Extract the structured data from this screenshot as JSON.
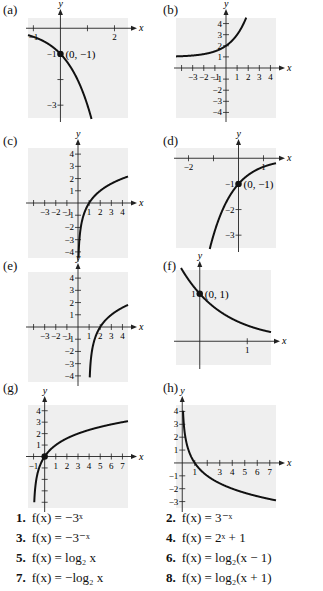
{
  "panels": [
    {
      "label": "(a)"
    },
    {
      "label": "(b)"
    },
    {
      "label": "(c)"
    },
    {
      "label": "(d)"
    },
    {
      "label": "(e)"
    },
    {
      "label": "(f)"
    },
    {
      "label": "(g)"
    },
    {
      "label": "(h)"
    }
  ],
  "choices": [
    {
      "num": "1.",
      "text": "f(x) = −3ˣ"
    },
    {
      "num": "2.",
      "text": "f(x) = 3⁻ˣ"
    },
    {
      "num": "3.",
      "text": "f(x) = −3⁻ˣ"
    },
    {
      "num": "4.",
      "text": "f(x) = 2ˣ + 1"
    },
    {
      "num": "5.",
      "text": "f(x) = log₂ x"
    },
    {
      "num": "6.",
      "text": "f(x) = log₂(x − 1)"
    },
    {
      "num": "7.",
      "text": "f(x) = −log₂ x"
    },
    {
      "num": "8.",
      "text": "f(x) = log₂(x + 1)"
    }
  ],
  "colors": {
    "plot_bg": "#efefef",
    "curve": "#111111",
    "axis": "#222222"
  },
  "chart_data": [
    {
      "panel": "(a)",
      "type": "line",
      "xlabel": "x",
      "ylabel": "y",
      "xlim": [
        -1.2,
        2.5
      ],
      "ylim": [
        -3.5,
        0.4
      ],
      "xticks": [
        -1,
        1,
        2
      ],
      "xtick_labels": [
        "-1",
        "",
        "2"
      ],
      "yticks": [
        -1,
        -2,
        -3
      ],
      "ytick_labels": [
        "-1",
        "",
        "-3"
      ],
      "annotation": {
        "point": [
          0,
          -1
        ],
        "text": "(0, −1)"
      },
      "function": "-3^x",
      "points": [
        [
          -1.1,
          -0.3
        ],
        [
          0,
          -1
        ],
        [
          1,
          -3
        ]
      ]
    },
    {
      "panel": "(b)",
      "type": "line",
      "xlabel": "x",
      "ylabel": "y",
      "xlim": [
        -4.5,
        4.5
      ],
      "ylim": [
        -4.5,
        4.5
      ],
      "xticks": [
        -4,
        -3,
        -2,
        -1,
        1,
        2,
        3,
        4
      ],
      "xtick_labels": [
        "",
        "-3",
        "-2",
        "-1",
        "1",
        "2",
        "3",
        "4"
      ],
      "yticks": [
        4,
        3,
        2,
        1,
        -1,
        -2,
        -3,
        -4
      ],
      "ytick_labels": [
        "4",
        "3",
        "2",
        "1",
        "-1",
        "-2",
        "-3",
        "-4"
      ],
      "function": "2^x + 1",
      "points": [
        [
          -4.5,
          1.04
        ],
        [
          0,
          2
        ],
        [
          1,
          3
        ],
        [
          1.7,
          4.2
        ]
      ]
    },
    {
      "panel": "(c)",
      "type": "line",
      "xlabel": "x",
      "ylabel": "y",
      "xlim": [
        -4.5,
        4.5
      ],
      "ylim": [
        -4.5,
        4.5
      ],
      "xticks": [
        -4,
        -3,
        -2,
        -1,
        1,
        2,
        3,
        4
      ],
      "xtick_labels": [
        "",
        "-3",
        "-2",
        "-1",
        "1",
        "2",
        "3",
        "4"
      ],
      "yticks": [
        4,
        3,
        2,
        1,
        -1,
        -2,
        -3,
        -4
      ],
      "ytick_labels": [
        "4",
        "3",
        "2",
        "1",
        "-1",
        "-2",
        "-3",
        "-4"
      ],
      "function": "log2(x)",
      "points": [
        [
          0.06,
          -4
        ],
        [
          0.5,
          -1
        ],
        [
          1,
          0
        ],
        [
          2,
          1
        ],
        [
          4,
          2
        ]
      ]
    },
    {
      "panel": "(d)",
      "type": "line",
      "xlabel": "x",
      "ylabel": "y",
      "xlim": [
        -2.5,
        1.5
      ],
      "ylim": [
        -3.5,
        0.4
      ],
      "xticks": [
        -2,
        -1,
        1
      ],
      "xtick_labels": [
        "-2",
        "",
        "1"
      ],
      "yticks": [
        -1,
        -2,
        -3
      ],
      "ytick_labels": [
        "-1",
        "-2",
        "-3"
      ],
      "annotation": {
        "point": [
          0,
          -1
        ],
        "text": "(0, −1)"
      },
      "function": "-3^(-x)",
      "points": [
        [
          -2.5,
          -0.06
        ],
        [
          -1,
          -0.33
        ],
        [
          0,
          -1
        ],
        [
          1.1,
          -3.4
        ]
      ]
    },
    {
      "panel": "(e)",
      "type": "line",
      "xlabel": "x",
      "ylabel": "y",
      "xlim": [
        -4.5,
        4.5
      ],
      "ylim": [
        -4.5,
        4.5
      ],
      "xticks": [
        -4,
        -3,
        -2,
        -1,
        1,
        2,
        3,
        4
      ],
      "xtick_labels": [
        "",
        "-3",
        "-2",
        "-1",
        "1",
        "2",
        "3",
        "4"
      ],
      "yticks": [
        4,
        3,
        2,
        1,
        -1,
        -2,
        -3,
        -4
      ],
      "ytick_labels": [
        "4",
        "3",
        "2",
        "1",
        "-1",
        "-2",
        "-3",
        "-4"
      ],
      "function": "log2(x-1)",
      "points": [
        [
          1.06,
          -4
        ],
        [
          1.5,
          -1
        ],
        [
          2,
          0
        ],
        [
          3,
          1
        ],
        [
          4.5,
          1.8
        ]
      ]
    },
    {
      "panel": "(f)",
      "type": "line",
      "xlabel": "x",
      "ylabel": "y",
      "xlim": [
        -0.5,
        1.5
      ],
      "ylim": [
        -0.5,
        1.5
      ],
      "xticks": [
        1
      ],
      "xtick_labels": [
        "1"
      ],
      "yticks": [
        1
      ],
      "ytick_labels": [
        "1"
      ],
      "annotation": {
        "point": [
          0,
          1
        ],
        "text": "(0, 1)"
      },
      "function": "3^(-x)",
      "points": [
        [
          -0.4,
          1.55
        ],
        [
          0,
          1
        ],
        [
          1,
          0.33
        ],
        [
          1.5,
          0.19
        ]
      ]
    },
    {
      "panel": "(g)",
      "type": "line",
      "xlabel": "x",
      "ylabel": "y",
      "xlim": [
        -1.5,
        7.5
      ],
      "ylim": [
        -4.5,
        4.5
      ],
      "xticks": [
        -1,
        1,
        2,
        3,
        4,
        5,
        6,
        7
      ],
      "xtick_labels": [
        "-1",
        "1",
        "2",
        "3",
        "4",
        "5",
        "6",
        "7"
      ],
      "yticks": [
        4,
        3,
        2,
        1,
        -1,
        -2,
        -3,
        -4
      ],
      "ytick_labels": [
        "4",
        "3",
        "2",
        "1",
        "",
        "",
        "",
        ""
      ],
      "annotation": {
        "point": [
          0,
          0
        ],
        "text": ""
      },
      "function": "log2(x+1)",
      "points": [
        [
          -0.94,
          -4
        ],
        [
          0,
          0
        ],
        [
          1,
          1
        ],
        [
          3,
          2
        ],
        [
          7,
          3
        ]
      ]
    },
    {
      "panel": "(h)",
      "type": "line",
      "xlabel": "x",
      "ylabel": "y",
      "xlim": [
        -0.5,
        7.5
      ],
      "ylim": [
        -3.5,
        4.5
      ],
      "xticks": [
        1,
        2,
        3,
        4,
        5,
        6,
        7
      ],
      "xtick_labels": [
        "1",
        "",
        "3",
        "4",
        "5",
        "6",
        "7"
      ],
      "yticks": [
        4,
        3,
        2,
        1,
        -1,
        -2,
        -3
      ],
      "ytick_labels": [
        "4",
        "3",
        "2",
        "1",
        "-1",
        "-2",
        "-3"
      ],
      "function": "-log2(x)",
      "points": [
        [
          0.06,
          4
        ],
        [
          0.5,
          1
        ],
        [
          1,
          0
        ],
        [
          2,
          -1
        ],
        [
          7,
          -2.8
        ]
      ]
    }
  ]
}
